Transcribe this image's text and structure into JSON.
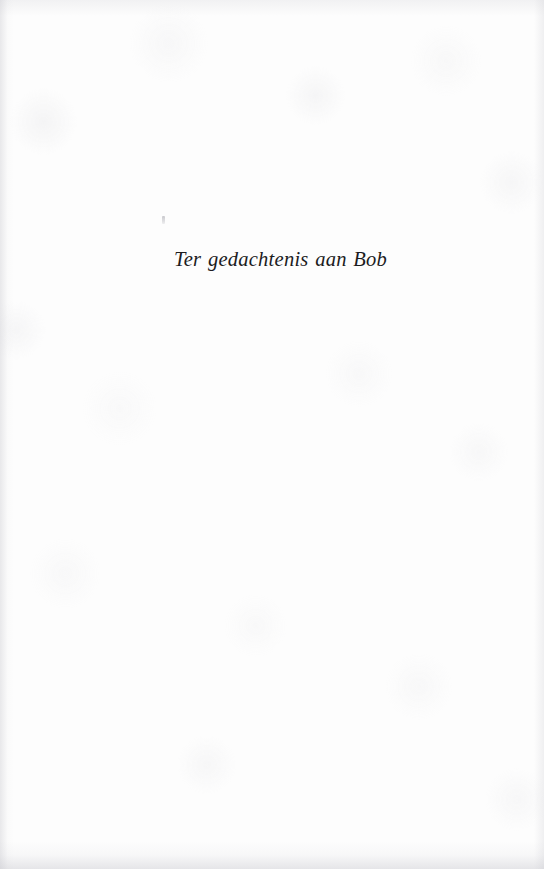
{
  "page": {
    "kind": "scanned-book-dedication-page",
    "width": 544,
    "height": 869,
    "background_color": "#fdfdfd",
    "text_color": "#1c1c1e"
  },
  "dedication": {
    "text": "Ter gedachtenis aan Bob",
    "style": "italic-serif",
    "alignment": "left-indented"
  },
  "artifacts": {
    "speck_label": "",
    "scan_speck_color": "#96969e"
  }
}
